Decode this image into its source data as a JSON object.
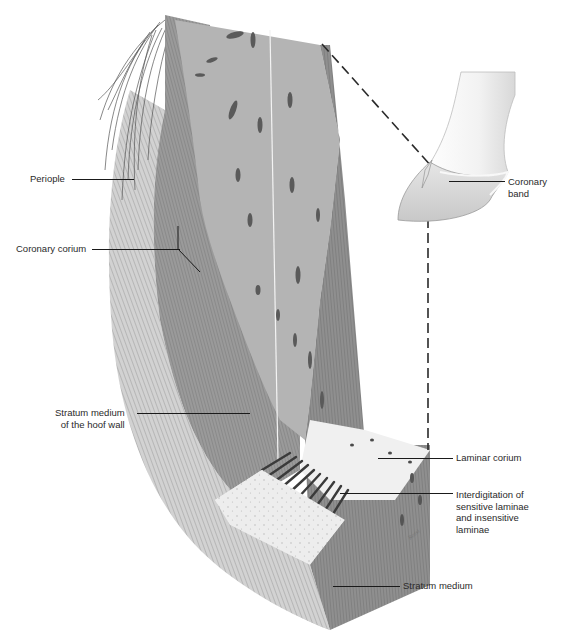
{
  "figure": {
    "colors": {
      "background": "#ffffff",
      "outer_wall": "#cfcfcf",
      "stratum_medium": "#8a8a8a",
      "corium": "#b0b0b0",
      "laminar_top": "#eeeeee",
      "label_text": "#2a2a2a",
      "leader_line": "#1a1a1a"
    }
  },
  "labels": {
    "periople": "Periople",
    "coronary_corium": "Coronary corium",
    "stratum_medium_hoof_wall": [
      "Stratum medium",
      "of the hoof wall"
    ],
    "coronary_band": [
      "Coronary",
      "band"
    ],
    "laminar_corium": "Laminar corium",
    "interdigitation": [
      "Interdigitation of",
      "sensitive laminae",
      "and insensitive",
      "laminae"
    ],
    "stratum_medium": "Stratum medium"
  },
  "signature": "Rossi"
}
